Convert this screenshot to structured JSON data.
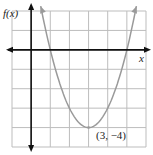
{
  "chart_data": {
    "type": "line",
    "title": "",
    "xlabel": "x",
    "ylabel": "f(x)",
    "xlim": [
      -1,
      6
    ],
    "ylim": [
      -5,
      2
    ],
    "grid": true,
    "grid_step": 1,
    "series": [
      {
        "name": "f(x) = (x - 3)^2 - 4",
        "color": "#9a9a9a",
        "x": [
          0.5,
          1,
          2,
          3,
          4,
          5,
          5.5
        ],
        "y": [
          2.25,
          0,
          -3,
          -4,
          -3,
          0,
          2.25
        ]
      }
    ],
    "annotations": [
      {
        "text": "(3, −4)",
        "x": 3,
        "y": -4
      }
    ],
    "colors": {
      "axis": "#111111",
      "grid": "#bdbdbd",
      "curve": "#9a9a9a"
    }
  }
}
